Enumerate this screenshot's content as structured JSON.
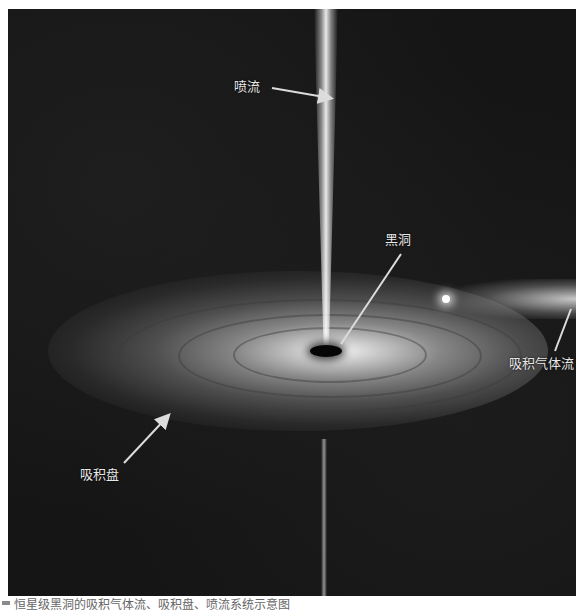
{
  "figure": {
    "labels": {
      "jet": "喷流",
      "black_hole": "黑洞",
      "accretion_stream": "吸积气体流",
      "accretion_disk": "吸积盘"
    },
    "caption": "恒星级黑洞的吸积气体流、吸积盘、喷流系统示意图",
    "colors": {
      "background": "#141414",
      "label": "#e8e8e8",
      "page": "#ffffff"
    }
  }
}
